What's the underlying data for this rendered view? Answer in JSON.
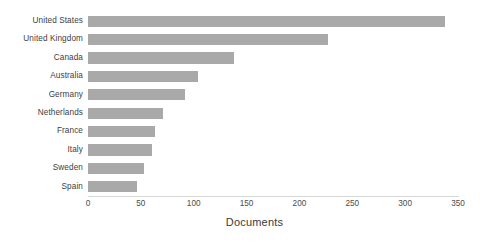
{
  "chart_data": {
    "type": "bar",
    "orientation": "horizontal",
    "title": "",
    "subtitle": "",
    "xlabel": "Documents",
    "ylabel": "",
    "categories": [
      "United States",
      "United Kingdom",
      "Canada",
      "Australia",
      "Germany",
      "Netherlands",
      "France",
      "Italy",
      "Sweden",
      "Spain"
    ],
    "values": [
      338,
      227,
      138,
      104,
      92,
      71,
      63,
      61,
      53,
      46
    ],
    "xlim": [
      0,
      350
    ],
    "xticks": [
      0,
      50,
      100,
      150,
      200,
      250,
      300,
      350
    ],
    "xtick_labels": [
      "0",
      "50",
      "100",
      "150",
      "200",
      "250",
      "300",
      "350"
    ],
    "grid": false,
    "legend": null,
    "bar_color": "#a9a9a9",
    "axis_color": "#d6d6d6",
    "text_color": "#3a3a3a"
  }
}
